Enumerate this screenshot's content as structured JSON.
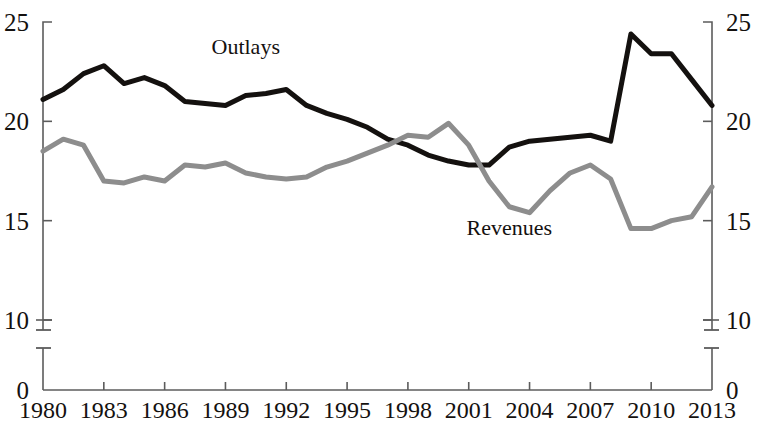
{
  "chart_data": {
    "type": "line",
    "title": "",
    "subtitle": "",
    "xlabel": "",
    "ylabel": "",
    "ylim": [
      10,
      25
    ],
    "ytick_values": [
      25,
      20,
      15,
      10,
      0
    ],
    "ytick_labels_left": [
      "25",
      "20",
      "15",
      "10",
      "0"
    ],
    "ytick_labels_right": [
      "25",
      "20",
      "15",
      "10",
      "0"
    ],
    "axis_break": true,
    "axis_break_between": [
      10,
      0
    ],
    "grid": false,
    "legend_position": "inline-annotation",
    "x": [
      1980,
      1981,
      1982,
      1983,
      1984,
      1985,
      1986,
      1987,
      1988,
      1989,
      1990,
      1991,
      1992,
      1993,
      1994,
      1995,
      1996,
      1997,
      1998,
      1999,
      2000,
      2001,
      2002,
      2003,
      2004,
      2005,
      2006,
      2007,
      2008,
      2009,
      2010,
      2011,
      2012,
      2013
    ],
    "xtick_labels": [
      "1980",
      "1983",
      "1986",
      "1989",
      "1992",
      "1995",
      "1998",
      "2001",
      "2004",
      "2007",
      "2010",
      "2013"
    ],
    "xtick_values": [
      1980,
      1983,
      1986,
      1989,
      1992,
      1995,
      1998,
      2001,
      2004,
      2007,
      2010,
      2013
    ],
    "xlim": [
      1980,
      2013
    ],
    "series": [
      {
        "name": "Outlays",
        "color": "#14110f",
        "line_width": 5,
        "label_x": 1990,
        "label_y": 23.4,
        "values": [
          21.1,
          21.6,
          22.4,
          22.8,
          21.9,
          22.2,
          21.8,
          21.0,
          20.9,
          20.8,
          21.3,
          21.4,
          21.6,
          20.8,
          20.4,
          20.1,
          19.7,
          19.1,
          18.8,
          18.3,
          18.0,
          17.8,
          17.8,
          18.7,
          19.0,
          19.1,
          19.2,
          19.3,
          19.0,
          24.4,
          23.4,
          23.4,
          22.1,
          20.8
        ]
      },
      {
        "name": "Revenues",
        "color": "#8d8d8d",
        "line_width": 5,
        "label_x": 2003,
        "label_y": 14.3,
        "values": [
          18.5,
          19.1,
          18.8,
          17.0,
          16.9,
          17.2,
          17.0,
          17.8,
          17.7,
          17.9,
          17.4,
          17.2,
          17.1,
          17.2,
          17.7,
          18.0,
          18.4,
          18.8,
          19.3,
          19.2,
          19.9,
          18.8,
          17.0,
          15.7,
          15.4,
          16.5,
          17.4,
          17.8,
          17.1,
          14.6,
          14.6,
          15.0,
          15.2,
          16.7
        ]
      }
    ],
    "annotations": [
      {
        "text": "Outlays",
        "series": "Outlays"
      },
      {
        "text": "Revenues",
        "series": "Revenues"
      }
    ]
  }
}
